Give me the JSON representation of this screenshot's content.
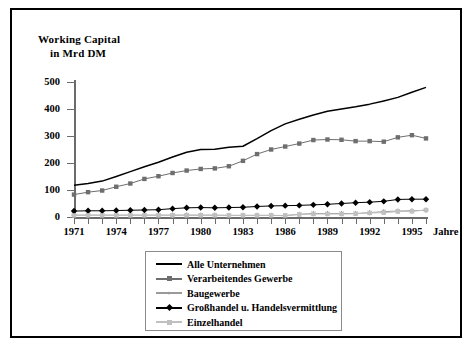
{
  "chart_data": {
    "type": "line",
    "title_line1": "Working Capital",
    "title_line2": "in Mrd DM",
    "xlabel": "Jahre",
    "ylabel": "Working Capital in Mrd DM",
    "ylim": [
      0,
      500
    ],
    "yticks": [
      0,
      100,
      200,
      300,
      400,
      500
    ],
    "xlim": [
      1971,
      1996
    ],
    "xticks": [
      1971,
      1974,
      1977,
      1980,
      1983,
      1986,
      1989,
      1992,
      1995
    ],
    "x": [
      1971,
      1972,
      1973,
      1974,
      1975,
      1976,
      1977,
      1978,
      1979,
      1980,
      1981,
      1982,
      1983,
      1984,
      1985,
      1986,
      1987,
      1988,
      1989,
      1990,
      1991,
      1992,
      1993,
      1994,
      1995,
      1996
    ],
    "grid": false,
    "legend_position": "below-center",
    "series": [
      {
        "name": "Alle Unternehmen",
        "color": "#000000",
        "marker": "none",
        "values": [
          118,
          124,
          133,
          150,
          168,
          186,
          203,
          222,
          240,
          250,
          251,
          258,
          262,
          290,
          320,
          345,
          362,
          378,
          392,
          400,
          408,
          418,
          430,
          443,
          462,
          480
        ]
      },
      {
        "name": "Verarbeitendes Gewerbe",
        "color": "#6e6e6e",
        "marker": "square",
        "values": [
          83,
          92,
          98,
          112,
          124,
          141,
          151,
          163,
          172,
          178,
          180,
          188,
          208,
          233,
          250,
          261,
          272,
          285,
          287,
          286,
          281,
          281,
          279,
          295,
          303,
          291
        ]
      },
      {
        "name": "Baugewerbe",
        "color": "#9a9a9a",
        "marker": "star",
        "values": [
          7,
          7,
          7,
          7,
          7,
          7,
          7,
          7,
          7,
          7,
          7,
          6,
          6,
          6,
          6,
          5,
          10,
          13,
          13,
          13,
          13,
          16,
          20,
          22,
          23,
          25
        ]
      },
      {
        "name": "Großhandel u. Handelsvermittlung",
        "color": "#000000",
        "marker": "diamond",
        "values": [
          22,
          23,
          23,
          24,
          25,
          26,
          27,
          31,
          34,
          35,
          34,
          35,
          36,
          39,
          41,
          42,
          43,
          45,
          47,
          50,
          53,
          55,
          58,
          65,
          66,
          66
        ]
      },
      {
        "name": "Einzelhandel",
        "color": "#c0c0c0",
        "marker": "square",
        "values": [
          6,
          6,
          6,
          6,
          6,
          6,
          6,
          6,
          6,
          6,
          6,
          6,
          6,
          6,
          6,
          6,
          9,
          11,
          11,
          11,
          12,
          15,
          16,
          20,
          21,
          26
        ]
      }
    ]
  },
  "legend": {
    "items": [
      {
        "label": "Alle Unternehmen"
      },
      {
        "label": "Verarbeitendes Gewerbe"
      },
      {
        "label": "Baugewerbe"
      },
      {
        "label": "Großhandel u. Handelsvermittlung"
      },
      {
        "label": "Einzelhandel"
      }
    ]
  }
}
